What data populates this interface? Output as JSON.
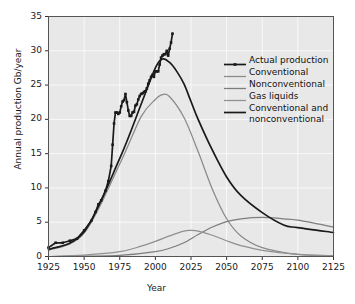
{
  "chart_data": {
    "type": "line",
    "title": "",
    "xlabel": "Year",
    "ylabel": "Annual production Gb/year",
    "xlim": [
      1925,
      2125
    ],
    "ylim": [
      0,
      35
    ],
    "xticks": [
      1925,
      1950,
      1975,
      2000,
      2025,
      2050,
      2075,
      2100,
      2125
    ],
    "yticks": [
      0,
      5,
      10,
      15,
      20,
      25,
      30,
      35
    ],
    "grid": true,
    "legend_position": "top-right",
    "series": [
      {
        "name": "Actual production",
        "style": "line-with-square-markers",
        "color": "#1a1a1a",
        "x": [
          1925,
          1930,
          1935,
          1940,
          1945,
          1950,
          1955,
          1958,
          1960,
          1962,
          1965,
          1967,
          1969,
          1970,
          1971,
          1972,
          1973,
          1974,
          1975,
          1976,
          1977,
          1978,
          1979,
          1980,
          1981,
          1982,
          1983,
          1984,
          1985,
          1986,
          1987,
          1988,
          1989,
          1990,
          1991,
          1992,
          1993,
          1994,
          1995,
          1996,
          1997,
          1998,
          1999,
          2000,
          2001,
          2002,
          2003,
          2004,
          2005,
          2006,
          2007,
          2008,
          2009,
          2010,
          2011,
          2012
        ],
        "y": [
          1.3,
          2.0,
          2.0,
          2.3,
          2.6,
          3.8,
          5.2,
          6.5,
          7.6,
          8.2,
          9.6,
          11.0,
          13.2,
          16.3,
          19.4,
          21.0,
          21.0,
          20.8,
          21.0,
          21.9,
          22.6,
          22.8,
          23.7,
          22.5,
          21.3,
          20.5,
          20.5,
          21.0,
          21.1,
          22.0,
          22.2,
          22.9,
          23.4,
          23.7,
          23.8,
          24.0,
          24.1,
          24.5,
          25.2,
          25.7,
          26.2,
          26.5,
          26.2,
          27.0,
          27.0,
          27.0,
          28.0,
          29.0,
          29.3,
          29.5,
          29.5,
          30.0,
          29.3,
          30.3,
          31.2,
          32.5
        ]
      },
      {
        "name": "Conventional",
        "style": "line",
        "color": "#8a8a8a",
        "peak_year": 2005,
        "peak_value": 23.6,
        "x": [
          1925,
          1950,
          1975,
          1990,
          2000,
          2005,
          2010,
          2020,
          2030,
          2040,
          2050,
          2060,
          2075,
          2100,
          2125
        ],
        "y": [
          0.9,
          3.4,
          13.5,
          20.4,
          22.9,
          23.6,
          23.3,
          20.3,
          15.3,
          9.8,
          5.5,
          3.0,
          1.3,
          0.3,
          0.1
        ]
      },
      {
        "name": "Nonconventional",
        "style": "line",
        "color": "#7d7d7d",
        "peak_year": 2075,
        "peak_value": 5.7,
        "x": [
          1925,
          1950,
          1975,
          2000,
          2010,
          2020,
          2030,
          2040,
          2050,
          2060,
          2075,
          2090,
          2100,
          2125
        ],
        "y": [
          0.0,
          0.05,
          0.15,
          0.7,
          1.2,
          2.0,
          3.2,
          4.3,
          5.1,
          5.5,
          5.7,
          5.5,
          5.3,
          4.3
        ]
      },
      {
        "name": "Gas liquids",
        "style": "line",
        "color": "#909090",
        "peak_year": 2025,
        "peak_value": 3.8,
        "x": [
          1925,
          1950,
          1975,
          1990,
          2000,
          2010,
          2020,
          2025,
          2030,
          2040,
          2050,
          2060,
          2075,
          2100,
          2125
        ],
        "y": [
          0.0,
          0.2,
          0.7,
          1.5,
          2.2,
          3.0,
          3.7,
          3.8,
          3.7,
          3.1,
          2.3,
          1.6,
          0.9,
          0.3,
          0.1
        ]
      },
      {
        "name": "Conventional and nonconventional",
        "style": "line",
        "color": "#1a1a1a",
        "peak_year": 2005,
        "peak_value": 28.8,
        "x": [
          1925,
          1950,
          1975,
          1990,
          2000,
          2005,
          2010,
          2015,
          2020,
          2025,
          2030,
          2040,
          2050,
          2060,
          2075,
          2090,
          2100,
          2125
        ],
        "y": [
          1.0,
          3.6,
          14.3,
          22.2,
          27.5,
          28.8,
          28.3,
          27.0,
          25.2,
          22.6,
          20.0,
          15.5,
          11.6,
          8.9,
          6.4,
          4.6,
          4.2,
          3.5
        ]
      }
    ]
  },
  "axes": {
    "y_title": "Annual production Gb/year",
    "x_title": "Year",
    "y_tick_labels": [
      "0",
      "5",
      "10",
      "15",
      "20",
      "25",
      "30",
      "35"
    ],
    "x_tick_labels": [
      "1925",
      "1950",
      "1975",
      "2000",
      "2025",
      "2050",
      "2075",
      "2100",
      "2125"
    ]
  },
  "legend": {
    "items": [
      {
        "label": "Actual production",
        "marker": "square-line",
        "color": "#1a1a1a"
      },
      {
        "label": "Conventional",
        "marker": "line",
        "color": "#8a8a8a"
      },
      {
        "label": "Nonconventional",
        "marker": "line",
        "color": "#7d7d7d"
      },
      {
        "label": "Gas liquids",
        "marker": "line",
        "color": "#909090"
      },
      {
        "label": "Conventional and nonconventional",
        "marker": "line",
        "color": "#1a1a1a"
      }
    ]
  }
}
